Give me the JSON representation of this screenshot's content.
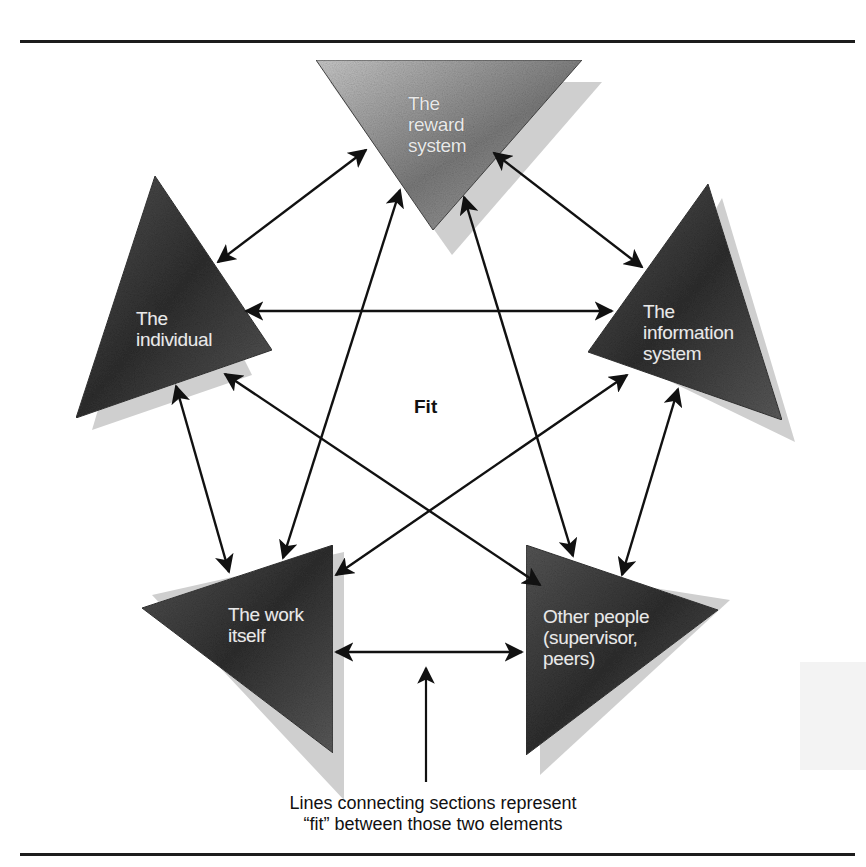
{
  "figure": {
    "center_label": "Fit",
    "caption": {
      "line1": "Lines connecting sections represent",
      "line2": "“fit” between those two elements"
    },
    "elements": [
      {
        "id": "reward",
        "line1": "The",
        "line2": "reward",
        "line3": "system"
      },
      {
        "id": "individual",
        "line1": "The",
        "line2": "individual"
      },
      {
        "id": "information",
        "line1": "The",
        "line2": "information",
        "line3": "system"
      },
      {
        "id": "work",
        "line1": "The work",
        "line2": "itself"
      },
      {
        "id": "others",
        "line1": "Other people",
        "line2": "(supervisor,",
        "line3": "peers)"
      }
    ],
    "connections": [
      {
        "from": "individual",
        "to": "reward"
      },
      {
        "from": "reward",
        "to": "information"
      },
      {
        "from": "individual",
        "to": "information"
      },
      {
        "from": "reward",
        "to": "work"
      },
      {
        "from": "reward",
        "to": "others"
      },
      {
        "from": "individual",
        "to": "work"
      },
      {
        "from": "individual",
        "to": "others"
      },
      {
        "from": "information",
        "to": "work"
      },
      {
        "from": "information",
        "to": "others"
      },
      {
        "from": "work",
        "to": "others"
      }
    ],
    "colors": {
      "triangle_fill_dark": "#3a3a3a",
      "triangle_fill_light": "#8c8c8c",
      "shadow": "#c8c8c8",
      "arrow": "#111111",
      "label_text": "#e9e9e9"
    }
  }
}
